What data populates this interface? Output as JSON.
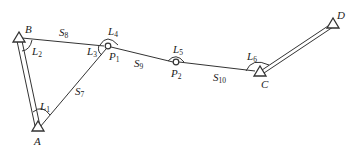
{
  "diagram": {
    "type": "traverse-survey",
    "colors": {
      "stroke": "#333333",
      "background": "#ffffff"
    },
    "control_points": [
      {
        "id": "A",
        "label": "A",
        "x": 38,
        "y": 129,
        "symbol": "triangle"
      },
      {
        "id": "B",
        "label": "B",
        "x": 19,
        "y": 39,
        "symbol": "triangle"
      },
      {
        "id": "C",
        "label": "C",
        "x": 260,
        "y": 73,
        "symbol": "triangle"
      },
      {
        "id": "D",
        "label": "D",
        "x": 332,
        "y": 24,
        "symbol": "triangle"
      }
    ],
    "traverse_points": [
      {
        "id": "P1",
        "label": "P",
        "sub": "1",
        "x": 108,
        "y": 46,
        "symbol": "circle"
      },
      {
        "id": "P2",
        "label": "P",
        "sub": "2",
        "x": 176,
        "y": 62,
        "symbol": "circle"
      }
    ],
    "known_sides": [
      {
        "from": "A",
        "to": "B"
      },
      {
        "from": "C",
        "to": "D"
      }
    ],
    "sides": [
      {
        "label": "S",
        "sub": "7",
        "from": "A",
        "to": "P1"
      },
      {
        "label": "S",
        "sub": "8",
        "from": "B",
        "to": "P1"
      },
      {
        "label": "S",
        "sub": "9",
        "from": "P1",
        "to": "P2"
      },
      {
        "label": "S",
        "sub": "10",
        "from": "P2",
        "to": "C"
      }
    ],
    "angles": [
      {
        "label": "L",
        "sub": "1",
        "at": "A"
      },
      {
        "label": "L",
        "sub": "2",
        "at": "B"
      },
      {
        "label": "L",
        "sub": "3",
        "at": "P1"
      },
      {
        "label": "L",
        "sub": "4",
        "at": "P1"
      },
      {
        "label": "L",
        "sub": "5",
        "at": "P2"
      },
      {
        "label": "L",
        "sub": "6",
        "at": "C"
      }
    ],
    "text": {
      "A": "A",
      "B": "B",
      "C": "C",
      "D": "D",
      "P": "P",
      "S": "S",
      "L": "L",
      "sub1": "1",
      "sub2": "2",
      "sub3": "3",
      "sub4": "4",
      "sub5": "5",
      "sub6": "6",
      "sub7": "7",
      "sub8": "8",
      "sub9": "9",
      "sub10": "10"
    }
  }
}
